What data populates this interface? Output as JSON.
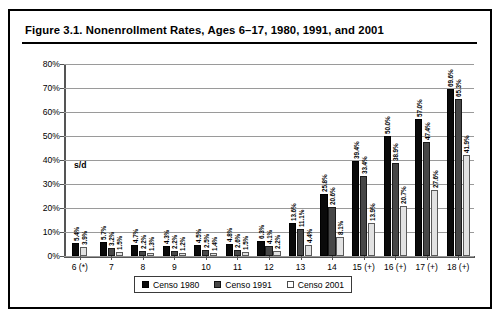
{
  "figure": {
    "title": "Figure 3.1.  Nonenrollment Rates, Ages 6–17, 1980, 1991, and 2001",
    "annotation": "s/d"
  },
  "chart_data": {
    "type": "bar",
    "title": "Figure 3.1.  Nonenrollment Rates, Ages 6–17, 1980, 1991, and 2001",
    "xlabel": "",
    "ylabel": "",
    "ylim": [
      0,
      80
    ],
    "yticks": [
      0,
      10,
      20,
      30,
      40,
      50,
      60,
      70,
      80
    ],
    "ytick_labels": [
      "0%",
      "10%",
      "20%",
      "30%",
      "40%",
      "50%",
      "60%",
      "70%",
      "80%"
    ],
    "grid": true,
    "legend_position": "bottom",
    "annotations": [
      {
        "text": "s/d",
        "meaning": "sin datos (no data) for Censo 1991 at age 6"
      }
    ],
    "categories": [
      "6 (*)",
      "7",
      "8",
      "9",
      "10",
      "11",
      "12",
      "13",
      "14",
      "15 (+)",
      "16 (+)",
      "17 (+)",
      "18 (+)"
    ],
    "series": [
      {
        "name": "Censo 1980",
        "color": "#0a0a0a",
        "values": [
          5.4,
          5.7,
          4.7,
          4.3,
          4.5,
          4.8,
          6.3,
          13.6,
          25.8,
          39.4,
          50.0,
          57.0,
          69.6
        ],
        "labels": [
          "5.4%",
          "5.7%",
          "4.7%",
          "4.3%",
          "4.5%",
          "4.8%",
          "6.3%",
          "13.6%",
          "25.8%",
          "39.4%",
          "50.0%",
          "57.0%",
          "69.6%"
        ]
      },
      {
        "name": "Censo 1991",
        "color": "#474747",
        "values": [
          null,
          3.2,
          2.2,
          2.2,
          2.5,
          2.6,
          4.1,
          11.1,
          20.6,
          33.4,
          38.9,
          47.4,
          65.3
        ],
        "labels": [
          "",
          "3.2%",
          "2.2%",
          "2.2%",
          "2.5%",
          "2.6%",
          "4.1%",
          "11.1%",
          "20.6%",
          "33.4%",
          "38.9%",
          "47.4%",
          "65.3%"
        ]
      },
      {
        "name": "Censo 2001",
        "color": "#e2e2e2",
        "values": [
          3.9,
          1.5,
          1.3,
          1.2,
          1.4,
          1.5,
          2.2,
          4.4,
          8.1,
          13.9,
          20.7,
          27.6,
          41.9
        ],
        "labels": [
          "3.9%",
          "1.5%",
          "1.3%",
          "1.2%",
          "1.4%",
          "1.5%",
          "2.2%",
          "4.4%",
          "8.1%",
          "13.9%",
          "20.7%",
          "27.6%",
          "41.9%"
        ]
      }
    ]
  },
  "legend": {
    "items": [
      {
        "label": "Censo 1980",
        "swatch": "c1980"
      },
      {
        "label": "Censo 1991",
        "swatch": "c1991"
      },
      {
        "label": "Censo 2001",
        "swatch": "c2001"
      }
    ]
  }
}
